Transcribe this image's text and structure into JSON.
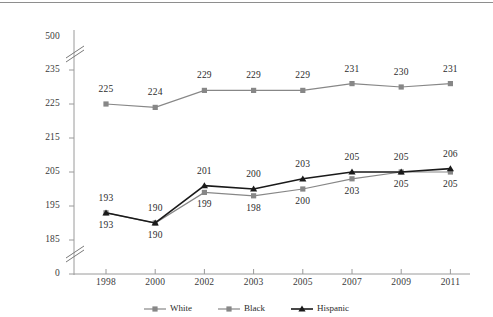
{
  "chart_data": {
    "type": "line",
    "title": "",
    "xlabel": "",
    "ylabel": "",
    "categories": [
      "1998",
      "2000",
      "2002",
      "2003",
      "2005",
      "2007",
      "2009",
      "2011"
    ],
    "ytick_labels": [
      "500",
      "235",
      "225",
      "215",
      "205",
      "195",
      "185",
      "0"
    ],
    "ylim": [
      185,
      235
    ],
    "axis_break": true,
    "grid": false,
    "legend_position": "bottom",
    "series": [
      {
        "name": "White",
        "color": "#878787",
        "marker": "square",
        "values": [
          225,
          224,
          229,
          229,
          229,
          231,
          230,
          231
        ],
        "labels": [
          "225",
          "224",
          "229",
          "229",
          "229",
          "231",
          "230",
          "231"
        ],
        "label_position": "above"
      },
      {
        "name": "Black",
        "color": "#878787",
        "marker": "square",
        "values": [
          193,
          190,
          199,
          198,
          200,
          203,
          205,
          205
        ],
        "labels": [
          "193",
          "190",
          "199",
          "198",
          "200",
          "203",
          "205",
          "205"
        ],
        "label_position": "below"
      },
      {
        "name": "Hispanic",
        "color": "#1a1a1a",
        "marker": "triangle",
        "values": [
          193,
          190,
          201,
          200,
          203,
          205,
          205,
          206
        ],
        "labels": [
          "193",
          "190",
          "201",
          "200",
          "203",
          "205",
          "205",
          "206"
        ],
        "label_position": "above"
      }
    ]
  },
  "legend": {
    "items": [
      {
        "label": "White",
        "color": "#878787",
        "marker": "square"
      },
      {
        "label": "Black",
        "color": "#878787",
        "marker": "square"
      },
      {
        "label": "Hispanic",
        "color": "#1a1a1a",
        "marker": "triangle"
      }
    ]
  }
}
